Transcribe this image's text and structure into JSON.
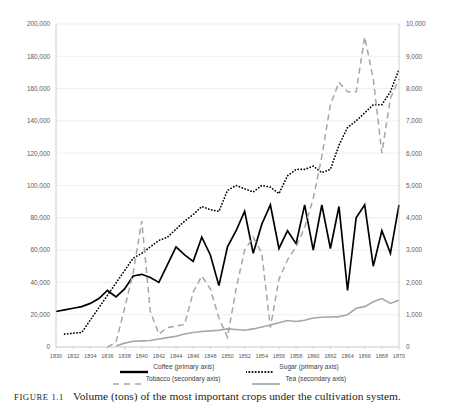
{
  "caption": {
    "figure_number": "FIGURE 1.1",
    "text": "Volume (tons) of the most important crops under the cultivation system."
  },
  "legend": {
    "items": [
      {
        "label": "Coffee (primary axis)",
        "style": "solid",
        "color": "#000000",
        "name": "legend-coffee"
      },
      {
        "label": "Sugar (primary axis)",
        "style": "dotted",
        "color": "#000000",
        "name": "legend-sugar"
      },
      {
        "label": "Tobacco (secondary axis)",
        "style": "dashed",
        "color": "#a6a6a6",
        "name": "legend-tobacco"
      },
      {
        "label": "Tea (secondary axis)",
        "style": "solid",
        "color": "#a6a6a6",
        "name": "legend-tea"
      }
    ]
  },
  "chart_data": {
    "type": "line",
    "title": "",
    "xlabel": "",
    "ylabel": "",
    "grid": true,
    "legend_position": "bottom",
    "x": [
      1830,
      1831,
      1832,
      1833,
      1834,
      1835,
      1836,
      1837,
      1838,
      1839,
      1840,
      1841,
      1842,
      1843,
      1844,
      1845,
      1846,
      1847,
      1848,
      1849,
      1850,
      1851,
      1852,
      1853,
      1854,
      1855,
      1856,
      1857,
      1858,
      1859,
      1860,
      1861,
      1862,
      1863,
      1864,
      1865,
      1866,
      1867,
      1868,
      1869,
      1870
    ],
    "primary_axis": {
      "label": "",
      "ylim": [
        0,
        200000
      ],
      "ticks": [
        "0",
        "20,000",
        "40,000",
        "60,000",
        "80,000",
        "100,000",
        "120,000",
        "140,000",
        "160,000",
        "180,000",
        "200,000"
      ],
      "tick_values": [
        0,
        20000,
        40000,
        60000,
        80000,
        100000,
        120000,
        140000,
        160000,
        180000,
        200000
      ]
    },
    "secondary_axis": {
      "label": "",
      "ylim": [
        0,
        10000
      ],
      "ticks": [
        "0",
        "1,000",
        "2,000",
        "3,000",
        "4,000",
        "5,000",
        "6,000",
        "7,000",
        "8,000",
        "9,000",
        "10,000"
      ],
      "tick_values": [
        0,
        1000,
        2000,
        3000,
        4000,
        5000,
        6000,
        7000,
        8000,
        9000,
        10000
      ]
    },
    "xticks": [
      "1830",
      "1832",
      "1834",
      "1836",
      "1838",
      "1840",
      "1842",
      "1844",
      "1846",
      "1848",
      "1850",
      "1852",
      "1854",
      "1856",
      "1858",
      "1860",
      "1862",
      "1864",
      "1866",
      "1868",
      "1870"
    ],
    "xtick_values": [
      1830,
      1832,
      1834,
      1836,
      1838,
      1840,
      1842,
      1844,
      1846,
      1848,
      1850,
      1852,
      1854,
      1856,
      1858,
      1860,
      1862,
      1864,
      1866,
      1868,
      1870
    ],
    "series": [
      {
        "name": "Coffee (primary axis)",
        "axis": "primary",
        "style": "solid",
        "color": "#000000",
        "x": [
          1830,
          1831,
          1832,
          1833,
          1834,
          1835,
          1836,
          1837,
          1838,
          1839,
          1840,
          1841,
          1842,
          1843,
          1844,
          1845,
          1846,
          1847,
          1848,
          1849,
          1850,
          1851,
          1852,
          1853,
          1854,
          1855,
          1856,
          1857,
          1858,
          1859,
          1860,
          1861,
          1862,
          1863,
          1864,
          1865,
          1866,
          1867,
          1868,
          1869,
          1870
        ],
        "values": [
          22000,
          23000,
          24000,
          25000,
          27000,
          30000,
          35000,
          31000,
          36000,
          44000,
          45000,
          43000,
          40000,
          51000,
          62000,
          57000,
          53000,
          68000,
          57000,
          38000,
          62000,
          72000,
          84000,
          58000,
          76000,
          88000,
          61000,
          72000,
          64000,
          88000,
          60000,
          88000,
          61000,
          87000,
          35000,
          80000,
          88000,
          50000,
          72000,
          58000,
          88000
        ]
      },
      {
        "name": "Sugar (primary axis)",
        "axis": "primary",
        "style": "dotted",
        "color": "#000000",
        "x": [
          1831,
          1832,
          1833,
          1839,
          1840,
          1841,
          1842,
          1843,
          1844,
          1845,
          1846,
          1847,
          1848,
          1849,
          1850,
          1851,
          1852,
          1853,
          1854,
          1855,
          1856,
          1857,
          1858,
          1859,
          1860,
          1861,
          1862,
          1863,
          1864,
          1865,
          1866,
          1867,
          1868,
          1869,
          1870
        ],
        "values": [
          8000,
          8500,
          9000,
          55000,
          58000,
          62000,
          66000,
          68000,
          73000,
          78000,
          82000,
          87000,
          85000,
          84000,
          97000,
          100000,
          98000,
          96000,
          100000,
          99000,
          95000,
          106000,
          110000,
          110000,
          112000,
          108000,
          110000,
          125000,
          136000,
          140000,
          145000,
          150000,
          150000,
          158000,
          172000
        ]
      },
      {
        "name": "Tobacco (secondary axis)",
        "axis": "secondary",
        "style": "dashed",
        "color": "#a6a6a6",
        "x": [
          1836,
          1837,
          1838,
          1839,
          1840,
          1841,
          1842,
          1843,
          1844,
          1845,
          1846,
          1847,
          1848,
          1849,
          1850,
          1851,
          1852,
          1853,
          1854,
          1855,
          1856,
          1857,
          1858,
          1859,
          1860,
          1861,
          1862,
          1863,
          1864,
          1865,
          1866,
          1867,
          1868,
          1869,
          1870
        ],
        "values": [
          0,
          150,
          1200,
          2300,
          3900,
          1100,
          400,
          600,
          650,
          700,
          1700,
          2200,
          1800,
          900,
          300,
          1800,
          3000,
          3400,
          2900,
          600,
          2100,
          2700,
          3100,
          3700,
          4600,
          5900,
          7500,
          8200,
          7900,
          7900,
          9600,
          8300,
          6000,
          7700,
          8300
        ]
      },
      {
        "name": "Tea (secondary axis)",
        "axis": "secondary",
        "style": "solid",
        "color": "#a6a6a6",
        "x": [
          1837,
          1838,
          1839,
          1840,
          1841,
          1842,
          1843,
          1844,
          1845,
          1846,
          1847,
          1848,
          1849,
          1850,
          1851,
          1852,
          1853,
          1854,
          1855,
          1856,
          1857,
          1858,
          1859,
          1860,
          1861,
          1862,
          1863,
          1864,
          1865,
          1866,
          1867,
          1868,
          1869,
          1870
        ],
        "values": [
          30,
          120,
          180,
          190,
          200,
          250,
          290,
          330,
          400,
          450,
          480,
          500,
          520,
          560,
          540,
          520,
          560,
          620,
          680,
          750,
          820,
          790,
          830,
          900,
          920,
          930,
          940,
          1000,
          1200,
          1250,
          1400,
          1500,
          1350,
          1450
        ]
      }
    ]
  }
}
